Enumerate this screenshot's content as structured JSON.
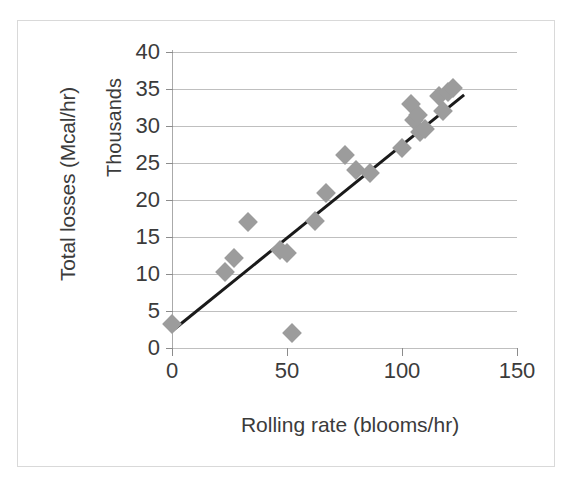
{
  "chart_data": {
    "type": "scatter",
    "title": "",
    "xlabel": "Rolling rate (blooms/hr)",
    "ylabel": "Total losses (Mcal/hr)",
    "y_scale_label": "Thousands",
    "xlim": [
      0,
      150
    ],
    "ylim": [
      0,
      40
    ],
    "x_ticks": [
      "0",
      "50",
      "100",
      "150"
    ],
    "x_tick_values": [
      0,
      50,
      100,
      150
    ],
    "y_ticks": [
      "0",
      "5",
      "10",
      "15",
      "20",
      "25",
      "30",
      "35",
      "40"
    ],
    "y_tick_values": [
      0,
      5,
      10,
      15,
      20,
      25,
      30,
      35,
      40
    ],
    "grid": "horizontal",
    "legend": "none",
    "marker_shape": "diamond",
    "marker_color": "#9c9c9c",
    "trendline": {
      "shown": true,
      "color": "#1a1a1a",
      "x_start": 0,
      "y_start": 2.3,
      "x_end": 127,
      "y_end": 34.2
    },
    "points": [
      {
        "x": 0,
        "y": 3.2
      },
      {
        "x": 23,
        "y": 10.3
      },
      {
        "x": 27,
        "y": 12.2
      },
      {
        "x": 33,
        "y": 17.0
      },
      {
        "x": 47,
        "y": 13.3
      },
      {
        "x": 50,
        "y": 12.8
      },
      {
        "x": 52,
        "y": 2.0
      },
      {
        "x": 62,
        "y": 17.2
      },
      {
        "x": 67,
        "y": 21.0
      },
      {
        "x": 75,
        "y": 26.1
      },
      {
        "x": 80,
        "y": 24.0
      },
      {
        "x": 86,
        "y": 23.7
      },
      {
        "x": 100,
        "y": 27.0
      },
      {
        "x": 104,
        "y": 33.0
      },
      {
        "x": 105,
        "y": 30.8
      },
      {
        "x": 107,
        "y": 31.5
      },
      {
        "x": 108,
        "y": 29.2
      },
      {
        "x": 110,
        "y": 29.6
      },
      {
        "x": 116,
        "y": 34.0
      },
      {
        "x": 118,
        "y": 32.0
      },
      {
        "x": 120,
        "y": 34.6
      },
      {
        "x": 122,
        "y": 35.2
      }
    ]
  },
  "caption": {
    "text": ""
  }
}
